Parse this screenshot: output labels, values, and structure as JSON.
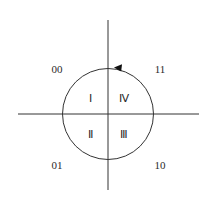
{
  "diagram": {
    "type": "phase-quadrant-diagram",
    "center": {
      "x": 108,
      "y": 114
    },
    "circle_radius": 45,
    "rotation_direction": "counterclockwise",
    "arrow_position": "top, right of vertical axis",
    "corner_labels": {
      "top_left": "00",
      "top_right": "11",
      "bottom_left": "01",
      "bottom_right": "10"
    },
    "quadrant_labels": {
      "upper_left": "Ⅰ",
      "lower_left": "Ⅱ",
      "lower_right": "Ⅲ",
      "upper_right": "Ⅳ"
    },
    "colors": {
      "line": "#333333",
      "text": "#2a2a2a",
      "background": "#ffffff"
    }
  }
}
